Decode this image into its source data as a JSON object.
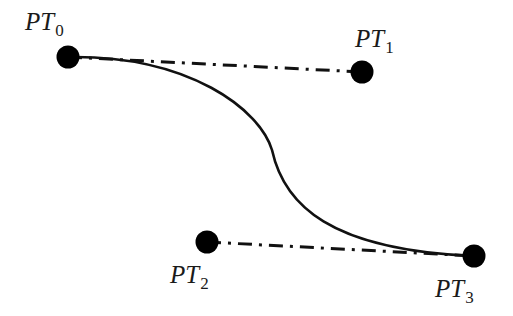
{
  "diagram": {
    "type": "cubic-bezier-curve",
    "colors": {
      "stroke": "#111111",
      "point": "#000000",
      "text": "#1a1a1a",
      "background": "#ffffff"
    },
    "points": [
      {
        "id": "PT0",
        "base": "PT",
        "sub": "0",
        "x": 68,
        "y": 57,
        "label_x": 25,
        "label_y": 30
      },
      {
        "id": "PT1",
        "base": "PT",
        "sub": "1",
        "x": 362,
        "y": 72,
        "label_x": 355,
        "label_y": 47
      },
      {
        "id": "PT2",
        "base": "PT",
        "sub": "2",
        "x": 207,
        "y": 242,
        "label_x": 170,
        "label_y": 283
      },
      {
        "id": "PT3",
        "base": "PT",
        "sub": "3",
        "x": 474,
        "y": 256,
        "label_x": 435,
        "label_y": 297
      }
    ],
    "control_lines": [
      {
        "from": "PT0",
        "to": "PT1",
        "style": "dash-dot"
      },
      {
        "from": "PT2",
        "to": "PT3",
        "style": "dash-dot"
      }
    ],
    "curve": {
      "from": "PT0",
      "to": "PT3",
      "style": "solid"
    }
  }
}
